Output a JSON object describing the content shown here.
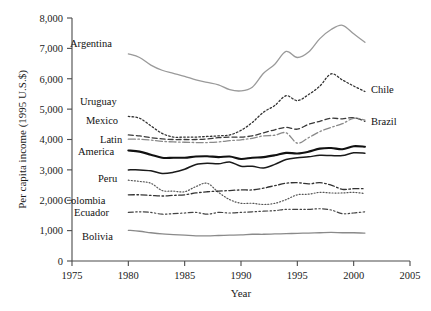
{
  "chart_data": {
    "type": "line",
    "title": "",
    "xlabel": "Year",
    "ylabel": "Per capita income (1995 U.S.$)",
    "xlim": [
      1975,
      2005
    ],
    "ylim": [
      0,
      8000
    ],
    "xticks": [
      1975,
      1980,
      1985,
      1990,
      1995,
      2000,
      2005
    ],
    "xtick_labels": [
      "1975",
      "1980",
      "1985",
      "1990",
      "1995",
      "2000",
      "2005"
    ],
    "yticks": [
      0,
      1000,
      2000,
      3000,
      4000,
      5000,
      6000,
      7000,
      8000
    ],
    "ytick_labels": [
      "0",
      "1,000",
      "2,000",
      "3,000",
      "4,000",
      "5,000",
      "6,000",
      "7,000",
      "8,000"
    ],
    "grid": false,
    "legend_position": "inline-labels",
    "x": [
      1980,
      1981,
      1982,
      1983,
      1984,
      1985,
      1986,
      1987,
      1988,
      1989,
      1990,
      1991,
      1992,
      1993,
      1994,
      1995,
      1996,
      1997,
      1998,
      1999,
      2000,
      2001
    ],
    "series": [
      {
        "name": "Argentina",
        "style": "solid-light",
        "color": "#9a9a9a",
        "label_side": "left",
        "values": [
          6820,
          6700,
          6450,
          6280,
          6180,
          6080,
          5960,
          5880,
          5800,
          5640,
          5600,
          5720,
          6180,
          6480,
          6900,
          6700,
          6880,
          7320,
          7620,
          7760,
          7480,
          7200
        ]
      },
      {
        "name": "Chile",
        "style": "dotted",
        "color": "#333333",
        "label_side": "right",
        "values": [
          4760,
          4700,
          4450,
          4200,
          4080,
          4080,
          4080,
          4100,
          4120,
          4150,
          4300,
          4560,
          4900,
          5120,
          5440,
          5280,
          5480,
          5760,
          6160,
          5960,
          5760,
          5580
        ]
      },
      {
        "name": "Uruguay",
        "style": "dashed",
        "color": "#3a3a3a",
        "label_side": "left",
        "values": [
          4150,
          4120,
          4060,
          4020,
          4000,
          4000,
          4000,
          4020,
          4060,
          4080,
          4080,
          4120,
          4220,
          4320,
          4400,
          4340,
          4500,
          4600,
          4700,
          4680,
          4720,
          4600
        ]
      },
      {
        "name": "Mexico",
        "style": "dash-dot-light",
        "color": "#8a8a8a",
        "label_side": "right",
        "values": [
          4010,
          4010,
          3980,
          3940,
          3920,
          3910,
          3900,
          3900,
          3920,
          3960,
          3990,
          4040,
          4120,
          4140,
          4220,
          3880,
          4060,
          4260,
          4400,
          4520,
          4700,
          4640
        ]
      },
      {
        "name": "Brazil",
        "style": "solid-dark",
        "color": "#1a1a1a",
        "label_side": "right",
        "values": [
          3000,
          3000,
          2970,
          2880,
          2920,
          3020,
          3180,
          3220,
          3200,
          3260,
          3120,
          3120,
          3060,
          3180,
          3340,
          3400,
          3430,
          3480,
          3470,
          3470,
          3560,
          3550
        ]
      },
      {
        "name": "Latin America",
        "style": "solid-thick",
        "color": "#111111",
        "label_side": "left",
        "values": [
          3640,
          3600,
          3500,
          3400,
          3400,
          3400,
          3440,
          3450,
          3420,
          3440,
          3360,
          3400,
          3420,
          3480,
          3560,
          3540,
          3600,
          3700,
          3720,
          3680,
          3780,
          3760
        ]
      },
      {
        "name": "Peru",
        "style": "dotted-fine",
        "color": "#555555",
        "label_side": "left",
        "values": [
          2660,
          2620,
          2560,
          2320,
          2300,
          2280,
          2450,
          2560,
          2260,
          2020,
          1900,
          1900,
          1860,
          1900,
          2020,
          2180,
          2200,
          2260,
          2240,
          2240,
          2260,
          2220
        ]
      },
      {
        "name": "Colombia",
        "style": "dash-dot",
        "color": "#333333",
        "label_side": "left",
        "values": [
          2180,
          2180,
          2160,
          2140,
          2160,
          2180,
          2240,
          2280,
          2300,
          2320,
          2340,
          2340,
          2400,
          2480,
          2560,
          2580,
          2540,
          2580,
          2500,
          2360,
          2380,
          2380
        ]
      },
      {
        "name": "Ecuador",
        "style": "dash-dot-dot",
        "color": "#444444",
        "label_side": "left",
        "values": [
          1600,
          1620,
          1600,
          1540,
          1560,
          1580,
          1600,
          1540,
          1600,
          1580,
          1600,
          1620,
          1640,
          1660,
          1700,
          1700,
          1700,
          1720,
          1680,
          1560,
          1580,
          1620
        ]
      },
      {
        "name": "Bolivia",
        "style": "solid-grey",
        "color": "#8a8a8a",
        "label_side": "left",
        "values": [
          1010,
          980,
          930,
          890,
          870,
          850,
          830,
          830,
          840,
          850,
          860,
          880,
          880,
          890,
          900,
          910,
          920,
          930,
          940,
          930,
          930,
          920
        ]
      }
    ]
  },
  "labels": {
    "argentina": "Argentina",
    "uruguay": "Uruguay",
    "mexico": "Mexico",
    "latin_america_line1": "Latin",
    "latin_america_line2": "America",
    "peru": "Peru",
    "colombia": "Colombia",
    "ecuador": "Ecuador",
    "bolivia": "Bolivia",
    "chile": "Chile",
    "brazil": "Brazil"
  }
}
